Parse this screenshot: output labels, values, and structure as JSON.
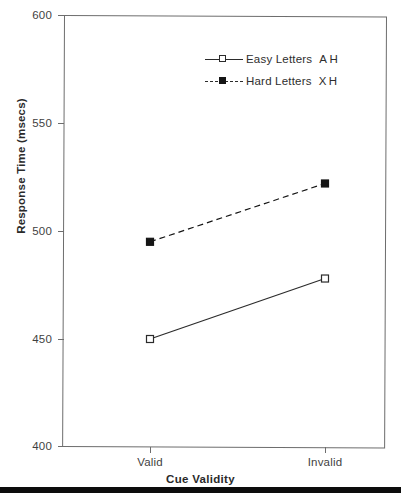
{
  "chart_data": {
    "type": "line",
    "title": "",
    "xlabel": "Cue Validity",
    "ylabel": "Response Time (msecs)",
    "categories": [
      "Valid",
      "Invalid"
    ],
    "ylim": [
      400,
      600
    ],
    "yticks": [
      400,
      450,
      500,
      550,
      600
    ],
    "ytick_labels": [
      "400",
      "450",
      "500",
      "550",
      "600"
    ],
    "grid": false,
    "legend_position": "upper right",
    "series": [
      {
        "name": "Easy Letters",
        "glyphs": "A H",
        "linestyle": "solid",
        "marker": "open-square",
        "color": "#2b2b2b",
        "values": [
          450,
          478
        ]
      },
      {
        "name": "Hard Letters",
        "glyphs": "X H",
        "linestyle": "dashed",
        "marker": "filled-square",
        "color": "#151515",
        "values": [
          495,
          522
        ]
      }
    ]
  },
  "axes": {
    "y_title": "Response Time (msecs)",
    "x_title": "Cue Validity",
    "y_tick_labels": [
      "600",
      "550",
      "500",
      "450",
      "400"
    ],
    "x_tick_labels": [
      "Valid",
      "Invalid"
    ]
  },
  "legend": {
    "items": [
      {
        "label": "Easy Letters",
        "glyphs_left": "A",
        "glyphs_right": "H"
      },
      {
        "label": "Hard Letters",
        "glyphs_left": "X",
        "glyphs_right": "H"
      }
    ]
  },
  "colors": {
    "frame": "#6d6d6d",
    "easy_series": "#2b2b2b",
    "hard_series": "#151515",
    "text": "#3a3a3a",
    "background": "#ffffff"
  }
}
